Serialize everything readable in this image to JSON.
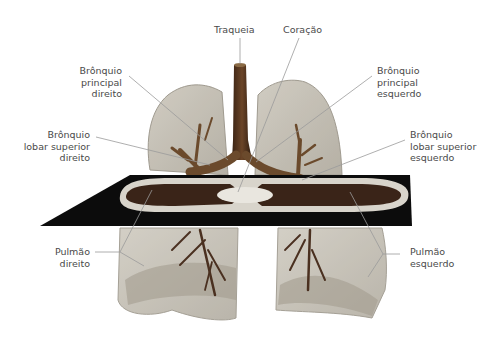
{
  "figure": {
    "colors": {
      "background": "#ffffff",
      "lung_fill": "#b9b3a6",
      "lung_edge": "#8f897c",
      "airway": "#5a3a22",
      "airway_light": "#8a6a45",
      "slice_dark": "#0c0c0c",
      "slice_tissue": "#3a2418",
      "slice_rim": "#d8d4cb",
      "leader_line": "#9a9a9a",
      "label_text": "#4a4a4a"
    }
  },
  "labels": {
    "trachea": "Traqueia",
    "heart": "Coração",
    "right_main_bronchus": "Brônquio\nprincipal\ndireito",
    "left_main_bronchus": "Brônquio\nprincipal\nesquerdo",
    "right_upper_lobe_bronchus": "Brônquio\nlobar superior\ndireito",
    "left_upper_lobe_bronchus": "Brônquio\nlobar superior\nesquerdo",
    "right_lung": "Pulmão\ndireito",
    "left_lung": "Pulmão\nesquerdo"
  }
}
